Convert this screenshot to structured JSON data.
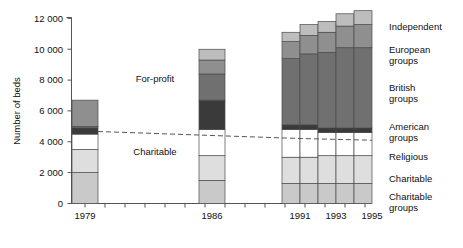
{
  "chart_data": {
    "type": "bar",
    "title": "",
    "xlabel": "",
    "ylabel": "Number of beds",
    "ylim": [
      0,
      12000
    ],
    "ytick_labels": [
      "0",
      "2 000",
      "4 000",
      "6 000",
      "8 000",
      "10 000",
      "12 000"
    ],
    "ytick_values": [
      0,
      2000,
      4000,
      6000,
      8000,
      10000,
      12000
    ],
    "grid": false,
    "legend_position": "right",
    "stacked": true,
    "categories": [
      "1979",
      "1986",
      "1991",
      "1992",
      "1993",
      "1994",
      "1995"
    ],
    "xtick_labels": [
      "1979",
      "1986",
      "1991",
      "1993",
      "1995"
    ],
    "series": [
      {
        "name": "Charitable groups",
        "values": [
          2000,
          1500,
          1300,
          1300,
          1300,
          1300,
          1300
        ]
      },
      {
        "name": "Charitable",
        "values": [
          1500,
          1600,
          1700,
          1700,
          1800,
          1800,
          1800
        ]
      },
      {
        "name": "Religious",
        "values": [
          1000,
          1700,
          1800,
          1800,
          1500,
          1500,
          1500
        ]
      },
      {
        "name": "American groups",
        "values": [
          400,
          1900,
          300,
          300,
          300,
          300,
          300
        ]
      },
      {
        "name": "British groups",
        "values": [
          100,
          1700,
          4300,
          4600,
          4900,
          5200,
          5200
        ]
      },
      {
        "name": "European groups",
        "values": [
          1700,
          900,
          1100,
          1200,
          1300,
          1400,
          1500
        ]
      },
      {
        "name": "Independent",
        "values": [
          0,
          700,
          600,
          700,
          700,
          800,
          900
        ]
      }
    ],
    "totals": [
      6700,
      10000,
      11100,
      11600,
      11800,
      12300,
      12500
    ],
    "annotations": [
      {
        "text": "For-profit",
        "x": 1982.5,
        "y": 7800
      },
      {
        "text": "Charitable",
        "x": 1982.5,
        "y": 3300
      }
    ],
    "divider_line": {
      "label": "for-profit / charitable boundary",
      "style": "dashed",
      "points": [
        [
          1979,
          4800
        ],
        [
          1986,
          4500
        ],
        [
          1991,
          4300
        ]
      ]
    }
  },
  "legend": {
    "items": [
      {
        "label": "Independent"
      },
      {
        "label": "European",
        "label2": "groups"
      },
      {
        "label": "British",
        "label2": "groups"
      },
      {
        "label": "American",
        "label2": "groups"
      },
      {
        "label": "Religious"
      },
      {
        "label": "Charitable"
      },
      {
        "label": "Charitable",
        "label2": "groups"
      }
    ]
  },
  "colors": {
    "charitable_groups": "#c9c9c9",
    "charitable": "#dedede",
    "religious": "#ffffff",
    "american_groups": "#3a3a3a",
    "british_groups": "#707070",
    "european_groups": "#8f8f8f",
    "independent": "#bdbdbd",
    "axis": "#555555",
    "text": "#111111"
  }
}
